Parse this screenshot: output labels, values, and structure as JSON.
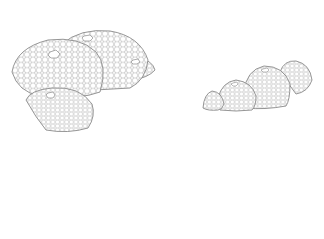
{
  "image": {
    "description": "Line drawing of two clusters of geodesic hexagonal-mesh dome structures",
    "background": "#ffffff",
    "stroke_color": "#8a8a8a",
    "mesh": "hexagon-icon",
    "clusters": [
      {
        "name": "left-cluster",
        "domes": [
          {
            "cx": 72,
            "cy": 70,
            "rx": 52,
            "ry": 33
          },
          {
            "cx": 103,
            "cy": 58,
            "rx": 44,
            "ry": 30
          },
          {
            "cx": 140,
            "cy": 68,
            "rx": 15,
            "ry": 10
          },
          {
            "cx": 62,
            "cy": 107,
            "rx": 35,
            "ry": 22
          }
        ]
      },
      {
        "name": "right-cluster",
        "domes": [
          {
            "cx": 214,
            "cy": 99,
            "rx": 11,
            "ry": 9
          },
          {
            "cx": 236,
            "cy": 95,
            "rx": 20,
            "ry": 16
          },
          {
            "cx": 265,
            "cy": 85,
            "rx": 25,
            "ry": 24
          },
          {
            "cx": 296,
            "cy": 77,
            "rx": 16,
            "ry": 17
          }
        ]
      }
    ]
  }
}
